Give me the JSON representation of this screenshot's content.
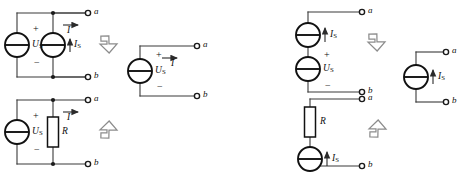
{
  "figure": {
    "kind": "circuit-equivalence-diagram",
    "colors": {
      "wire": "#3a3a3a",
      "symbol": "#111111",
      "background": "#ffffff",
      "big_arrow_outline": "#8c8c8c",
      "big_arrow_fill": "#ffffff"
    }
  },
  "labels": {
    "terminal_a": "a",
    "terminal_b": "b",
    "current_I": "I",
    "voltage_source": "U",
    "voltage_source_sub": "S",
    "current_source": "I",
    "current_source_sub": "S",
    "resistor": "R",
    "plus": "+",
    "minus": "−"
  },
  "panels": [
    {
      "id": "top-left-original",
      "position": "top-left",
      "role": "original-circuit",
      "elements": [
        {
          "type": "voltage-source",
          "label": "U",
          "sub": "S",
          "polarity_top": "+",
          "polarity_bottom": "−"
        },
        {
          "type": "current-source",
          "label": "I",
          "sub": "S",
          "arrow_direction": "up"
        },
        {
          "type": "terminal",
          "label": "a"
        },
        {
          "type": "terminal",
          "label": "b"
        },
        {
          "type": "current-arrow",
          "label": "I",
          "arrow_direction": "right"
        }
      ]
    },
    {
      "id": "top-middle-equivalent",
      "position": "top-middle",
      "role": "equivalent-circuit",
      "elements": [
        {
          "type": "voltage-source",
          "label": "U",
          "sub": "S",
          "polarity_top": "+",
          "polarity_bottom": "−"
        },
        {
          "type": "terminal",
          "label": "a"
        },
        {
          "type": "terminal",
          "label": "b"
        },
        {
          "type": "current-arrow",
          "label": "I",
          "arrow_direction": "right"
        }
      ]
    },
    {
      "id": "bottom-left-original",
      "position": "bottom-left",
      "role": "original-circuit",
      "elements": [
        {
          "type": "voltage-source",
          "label": "U",
          "sub": "S",
          "polarity_top": "+",
          "polarity_bottom": "−"
        },
        {
          "type": "resistor",
          "label": "R"
        },
        {
          "type": "terminal",
          "label": "a"
        },
        {
          "type": "terminal",
          "label": "b"
        },
        {
          "type": "current-arrow",
          "label": "I",
          "arrow_direction": "right"
        }
      ]
    },
    {
      "id": "top-right-original",
      "position": "top-right",
      "role": "original-circuit",
      "elements": [
        {
          "type": "current-source",
          "label": "I",
          "sub": "S",
          "arrow_direction": "up"
        },
        {
          "type": "voltage-source",
          "label": "U",
          "sub": "S",
          "polarity_top": "+",
          "polarity_bottom": "−"
        },
        {
          "type": "terminal",
          "label": "a"
        },
        {
          "type": "terminal",
          "label": "b"
        }
      ]
    },
    {
      "id": "far-right-equivalent",
      "position": "far-right",
      "role": "equivalent-circuit",
      "elements": [
        {
          "type": "current-source",
          "label": "I",
          "sub": "S",
          "arrow_direction": "up"
        },
        {
          "type": "terminal",
          "label": "a"
        },
        {
          "type": "terminal",
          "label": "b"
        }
      ]
    },
    {
      "id": "bottom-right-original",
      "position": "bottom-right",
      "role": "original-circuit",
      "elements": [
        {
          "type": "resistor",
          "label": "R"
        },
        {
          "type": "current-source",
          "label": "I",
          "sub": "S",
          "arrow_direction": "up"
        },
        {
          "type": "terminal",
          "label": "a"
        },
        {
          "type": "terminal",
          "label": "b"
        }
      ]
    }
  ],
  "equivalence_arrows": [
    {
      "id": "arrow-top-left",
      "direction": "down-right",
      "glyph": "block-arrow"
    },
    {
      "id": "arrow-bottom-left",
      "direction": "up-right",
      "glyph": "block-arrow"
    },
    {
      "id": "arrow-top-right",
      "direction": "down-right",
      "glyph": "block-arrow"
    },
    {
      "id": "arrow-bottom-right",
      "direction": "up-right",
      "glyph": "block-arrow"
    }
  ]
}
